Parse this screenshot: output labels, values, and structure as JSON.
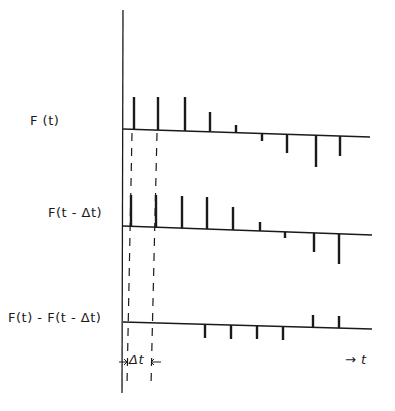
{
  "diagram": {
    "title": "",
    "colors": {
      "ink": "#1a1a1a",
      "background": "#ffffff"
    },
    "vertical_axis": {
      "x": 123,
      "y_top": 10,
      "y_bottom": 393
    },
    "rows": [
      {
        "label": "F (t)",
        "label_pos": {
          "x": 30,
          "y": 121
        },
        "baseline": {
          "x1": 123,
          "y1": 129,
          "x2": 370,
          "y2": 137
        },
        "spikes": [
          {
            "x": 134,
            "tip": 97
          },
          {
            "x": 158,
            "tip": 97
          },
          {
            "x": 185,
            "tip": 97
          },
          {
            "x": 210,
            "tip": 112
          },
          {
            "x": 236,
            "tip": 125
          },
          {
            "x": 262,
            "tip": 141
          },
          {
            "x": 287,
            "tip": 153
          },
          {
            "x": 316,
            "tip": 167
          },
          {
            "x": 340,
            "tip": 156
          }
        ]
      },
      {
        "label": "F(t - Δt)",
        "label_pos": {
          "x": 48,
          "y": 213
        },
        "baseline": {
          "x1": 123,
          "y1": 226,
          "x2": 372,
          "y2": 235
        },
        "spikes": [
          {
            "x": 131,
            "tip": 195
          },
          {
            "x": 156,
            "tip": 195
          },
          {
            "x": 182,
            "tip": 196
          },
          {
            "x": 207,
            "tip": 197
          },
          {
            "x": 233,
            "tip": 207
          },
          {
            "x": 260,
            "tip": 222
          },
          {
            "x": 285,
            "tip": 238
          },
          {
            "x": 314,
            "tip": 252
          },
          {
            "x": 339,
            "tip": 264
          }
        ]
      },
      {
        "label": "F(t) - F(t - Δt)",
        "label_pos": {
          "x": 8,
          "y": 318
        },
        "baseline": {
          "x1": 123,
          "y1": 322,
          "x2": 372,
          "y2": 329
        },
        "spikes": [
          {
            "x": 205,
            "tip": 338
          },
          {
            "x": 231,
            "tip": 339
          },
          {
            "x": 257,
            "tip": 339
          },
          {
            "x": 283,
            "tip": 340
          },
          {
            "x": 313,
            "tip": 315
          },
          {
            "x": 339,
            "tip": 316
          }
        ]
      }
    ],
    "guides": [
      {
        "x1": 132,
        "y1": 133,
        "x2": 127,
        "y2": 385
      },
      {
        "x1": 157,
        "y1": 133,
        "x2": 151,
        "y2": 385
      }
    ],
    "delta_t": {
      "label": "Δt",
      "label_pos": {
        "x": 129,
        "y": 352
      },
      "arrow_y": 362
    },
    "time_axis": {
      "label": "t",
      "arrow_label": "→ t",
      "label_pos": {
        "x": 345,
        "y": 352
      }
    }
  }
}
